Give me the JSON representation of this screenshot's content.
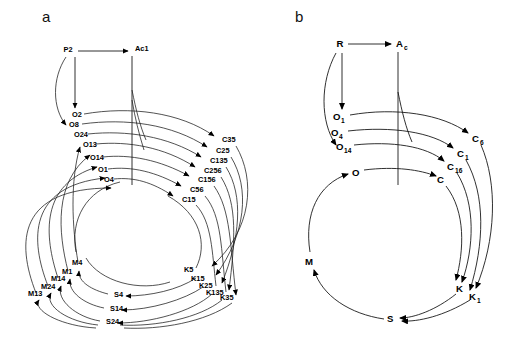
{
  "figure": {
    "background": "#ffffff",
    "ink": "#1a1a1a",
    "width": 505,
    "height": 339
  },
  "panels": [
    {
      "id": "a",
      "letter": "a",
      "letter_pos": {
        "x": 42,
        "y": 22
      },
      "source": {
        "label": "P2",
        "x": 68,
        "y": 52
      },
      "sink": {
        "label": "Ac1",
        "x": 135,
        "y": 51
      },
      "nodes_o": [
        {
          "label": "O2",
          "x": 72,
          "y": 117
        },
        {
          "label": "O8",
          "x": 69,
          "y": 127
        },
        {
          "label": "O24",
          "x": 74,
          "y": 137
        },
        {
          "label": "O13",
          "x": 83,
          "y": 147
        },
        {
          "label": "O14",
          "x": 90,
          "y": 160
        },
        {
          "label": "O1",
          "x": 98,
          "y": 172
        },
        {
          "label": "O4",
          "x": 104,
          "y": 182
        }
      ],
      "nodes_c": [
        {
          "label": "C35",
          "x": 222,
          "y": 142
        },
        {
          "label": "C25",
          "x": 216,
          "y": 153
        },
        {
          "label": "C135",
          "x": 210,
          "y": 163
        },
        {
          "label": "C256",
          "x": 204,
          "y": 173
        },
        {
          "label": "C156",
          "x": 198,
          "y": 182
        },
        {
          "label": "C56",
          "x": 190,
          "y": 192
        },
        {
          "label": "C15",
          "x": 182,
          "y": 202
        }
      ],
      "nodes_k": [
        {
          "label": "K5",
          "x": 188,
          "y": 272
        },
        {
          "label": "K15",
          "x": 195,
          "y": 281
        },
        {
          "label": "K25",
          "x": 203,
          "y": 288
        },
        {
          "label": "K135",
          "x": 211,
          "y": 295
        },
        {
          "label": "K35",
          "x": 223,
          "y": 299
        }
      ],
      "nodes_s": [
        {
          "label": "S4",
          "x": 117,
          "y": 296
        },
        {
          "label": "S14",
          "x": 113,
          "y": 310
        },
        {
          "label": "S24",
          "x": 109,
          "y": 323
        }
      ],
      "nodes_m": [
        {
          "label": "M4",
          "x": 72,
          "y": 265
        },
        {
          "label": "M1",
          "x": 63,
          "y": 274
        },
        {
          "label": "M14",
          "x": 54,
          "y": 281
        },
        {
          "label": "M24",
          "x": 44,
          "y": 289
        },
        {
          "label": "M13",
          "x": 32,
          "y": 296
        }
      ]
    },
    {
      "id": "b",
      "letter": "b",
      "letter_pos": {
        "x": 295,
        "y": 22
      },
      "source": {
        "label": "R",
        "x": 340,
        "y": 46
      },
      "sink": {
        "label": "A",
        "sub": "c",
        "x": 399,
        "y": 46
      },
      "nodes_o": [
        {
          "label": "O",
          "sub": "1",
          "x": 338,
          "y": 118
        },
        {
          "label": "O",
          "sub": "4",
          "x": 336,
          "y": 134
        },
        {
          "label": "O",
          "sub": "14",
          "x": 341,
          "y": 148
        },
        {
          "label": "O",
          "sub": "",
          "x": 355,
          "y": 173
        }
      ],
      "nodes_c": [
        {
          "label": "C",
          "sub": "6",
          "x": 474,
          "y": 139
        },
        {
          "label": "C",
          "sub": "1",
          "x": 459,
          "y": 154
        },
        {
          "label": "C",
          "sub": "16",
          "x": 450,
          "y": 167
        },
        {
          "label": "C",
          "sub": "",
          "x": 441,
          "y": 180
        }
      ],
      "nodes_k": [
        {
          "label": "K",
          "sub": "",
          "x": 460,
          "y": 288
        },
        {
          "label": "K",
          "sub": "1",
          "x": 473,
          "y": 296
        }
      ],
      "node_s": {
        "label": "S",
        "sub": "",
        "x": 391,
        "y": 318
      },
      "node_m": {
        "label": "M",
        "sub": "",
        "x": 309,
        "y": 261
      }
    }
  ],
  "cycle_order": [
    "O",
    "C",
    "K",
    "S",
    "M"
  ],
  "counts": {
    "panel_a_o": 7,
    "panel_a_c": 7,
    "panel_a_k": 5,
    "panel_a_s": 3,
    "panel_a_m": 5,
    "panel_b_o": 4,
    "panel_b_c": 4,
    "panel_b_k": 2
  }
}
